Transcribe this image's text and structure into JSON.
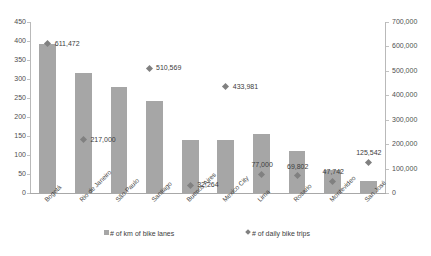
{
  "chart_data": {
    "type": "bar",
    "title": "",
    "subtitle": "",
    "xlabel": "",
    "ylabel": "",
    "categories": [
      "Bogotá",
      "Rio de Janeiro",
      "São Paulo",
      "Santiago",
      "Buenos Aires",
      "Mexico City",
      "Lima",
      "Rosario",
      "Montevideo",
      "San José"
    ],
    "grid": false,
    "legend_position": "bottom",
    "axes": {
      "left": {
        "label": "",
        "ticks": [
          "0",
          "50",
          "100",
          "150",
          "200",
          "250",
          "300",
          "350",
          "400",
          "450"
        ],
        "tick_values": [
          0,
          50,
          100,
          150,
          200,
          250,
          300,
          350,
          400,
          450
        ],
        "ylim": [
          0,
          450
        ]
      },
      "right": {
        "label": "",
        "ticks": [
          "0",
          "100,000",
          "200,000",
          "300,000",
          "400,000",
          "500,000",
          "600,000",
          "700,000"
        ],
        "tick_values": [
          0,
          100000,
          200000,
          300000,
          400000,
          500000,
          600000,
          700000
        ],
        "ylim": [
          0,
          700000
        ]
      }
    },
    "series": [
      {
        "name": "# of km of bike lanes",
        "type": "bar",
        "axis": "left",
        "color": "#a6a6a6",
        "values": [
          392,
          315,
          278,
          242,
          140,
          140,
          155,
          110,
          60,
          32
        ],
        "labels": [
          "",
          "",
          "",
          "",
          "",
          "",
          "",
          "",
          "",
          ""
        ]
      },
      {
        "name": "# of daily bike trips",
        "type": "scatter",
        "axis": "right",
        "color": "#808080",
        "values": [
          611472,
          217000,
          null,
          null,
          32264,
          433981,
          77000,
          69802,
          47742,
          125542
        ],
        "labels": [
          "611,472",
          "217,000",
          "",
          "",
          "32,264",
          "433,981",
          "77,000",
          "69,802",
          "47,742",
          "125,542"
        ],
        "extra_points": [
          {
            "category": "São Paulo",
            "value": 510569,
            "label": "510,569"
          }
        ]
      }
    ]
  },
  "legend": {
    "items": [
      {
        "label": "# of km of bike lanes",
        "marker": "square-swatch-icon"
      },
      {
        "label": "# of daily bike trips",
        "marker": "diamond-swatch-icon"
      }
    ]
  }
}
